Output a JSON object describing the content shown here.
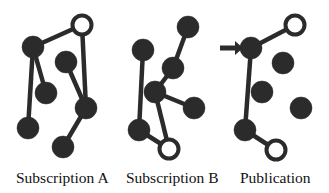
{
  "figure": {
    "type": "node-link-diagram",
    "background_color": "#ffffff",
    "node_fill_color": "#2b2b2b",
    "node_stroke_color": "#2b2b2b",
    "open_node_fill_color": "#ffffff",
    "edge_color": "#2b2b2b",
    "node_radius": 11,
    "open_node_radius": 9.5,
    "edge_width": 4.5
  },
  "panels": [
    {
      "id": "subscription-a",
      "label": "Subscription A",
      "nodes": [
        {
          "id": "a1",
          "x": 82,
          "y": 25,
          "style": "open"
        },
        {
          "id": "a2",
          "x": 33,
          "y": 47,
          "style": "filled"
        },
        {
          "id": "a3",
          "x": 66,
          "y": 62,
          "style": "filled"
        },
        {
          "id": "a4",
          "x": 46,
          "y": 93,
          "style": "filled"
        },
        {
          "id": "a5",
          "x": 86,
          "y": 108,
          "style": "filled"
        },
        {
          "id": "a6",
          "x": 28,
          "y": 128,
          "style": "filled"
        },
        {
          "id": "a7",
          "x": 63,
          "y": 147,
          "style": "filled"
        }
      ],
      "edges": [
        {
          "from": "a1",
          "to": "a2"
        },
        {
          "from": "a1",
          "to": "a5"
        },
        {
          "from": "a2",
          "to": "a4"
        },
        {
          "from": "a2",
          "to": "a6"
        },
        {
          "from": "a3",
          "to": "a5"
        },
        {
          "from": "a5",
          "to": "a7"
        }
      ],
      "arrows": []
    },
    {
      "id": "subscription-b",
      "label": "Subscription B",
      "nodes": [
        {
          "id": "b1",
          "x": 188,
          "y": 27,
          "style": "filled"
        },
        {
          "id": "b2",
          "x": 143,
          "y": 50,
          "style": "filled"
        },
        {
          "id": "b3",
          "x": 173,
          "y": 68,
          "style": "filled"
        },
        {
          "id": "b4",
          "x": 155,
          "y": 92,
          "style": "filled"
        },
        {
          "id": "b5",
          "x": 194,
          "y": 108,
          "style": "filled"
        },
        {
          "id": "b6",
          "x": 139,
          "y": 130,
          "style": "filled"
        },
        {
          "id": "b7",
          "x": 169,
          "y": 149,
          "style": "open"
        }
      ],
      "edges": [
        {
          "from": "b1",
          "to": "b3"
        },
        {
          "from": "b3",
          "to": "b4"
        },
        {
          "from": "b4",
          "to": "b5"
        },
        {
          "from": "b4",
          "to": "b7"
        },
        {
          "from": "b2",
          "to": "b6"
        },
        {
          "from": "b6",
          "to": "b7"
        }
      ],
      "arrows": []
    },
    {
      "id": "publication",
      "label": "Publication",
      "nodes": [
        {
          "id": "p1",
          "x": 295,
          "y": 25,
          "style": "open"
        },
        {
          "id": "p2",
          "x": 251,
          "y": 48,
          "style": "filled"
        },
        {
          "id": "p3",
          "x": 283,
          "y": 63,
          "style": "filled"
        },
        {
          "id": "p4",
          "x": 262,
          "y": 92,
          "style": "filled"
        },
        {
          "id": "p5",
          "x": 301,
          "y": 108,
          "style": "filled"
        },
        {
          "id": "p6",
          "x": 245,
          "y": 130,
          "style": "filled"
        },
        {
          "id": "p7",
          "x": 276,
          "y": 150,
          "style": "open"
        }
      ],
      "edges": [
        {
          "from": "p2",
          "to": "p1"
        },
        {
          "from": "p2",
          "to": "p6"
        },
        {
          "from": "p6",
          "to": "p7"
        }
      ],
      "arrows": [
        {
          "id": "publication-in-arrow",
          "x1": 220,
          "y1": 48,
          "x2": 243,
          "y2": 48
        }
      ]
    }
  ]
}
